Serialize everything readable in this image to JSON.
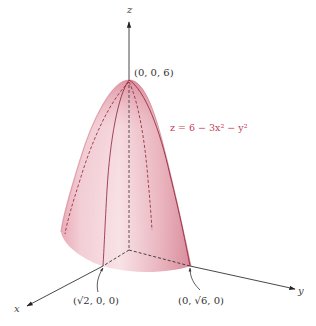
{
  "figure": {
    "type": "3D surface plot",
    "surface": "elliptic paraboloid",
    "equation": {
      "lhs": "z",
      "rhs": "= 6 − 3x² − y²",
      "full": "z = 6 − 3x² − y²",
      "color": "#c4405a"
    },
    "axes": {
      "x_label": "x",
      "y_label": "y",
      "z_label": "z"
    },
    "points": [
      {
        "name": "apex",
        "label": "(0, 0, 6)"
      },
      {
        "name": "x-intercept",
        "label": "(√2, 0, 0)"
      },
      {
        "name": "y-intercept",
        "label": "(0, √6, 0)"
      }
    ],
    "colors": {
      "surface_light": "#f7dfe3",
      "surface_mid": "#eab3bd",
      "surface_dark": "#d27d8e",
      "trace_line": "#8a1f33",
      "axis": "#333333"
    }
  }
}
